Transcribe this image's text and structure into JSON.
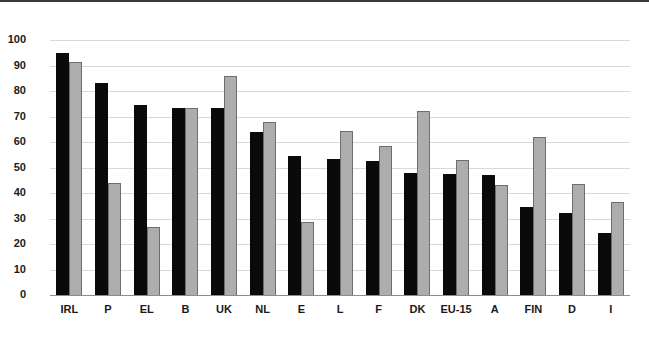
{
  "chart_data": {
    "type": "bar",
    "title": "",
    "subtitle": "",
    "xlabel": "",
    "ylabel": "",
    "ylim": [
      0,
      100
    ],
    "grid": true,
    "legend": "none",
    "orientation": "vertical",
    "categories": [
      "IRL",
      "P",
      "EL",
      "B",
      "UK",
      "NL",
      "E",
      "L",
      "F",
      "DK",
      "EU-15",
      "A",
      "FIN",
      "D",
      "I"
    ],
    "ytick_labels": [
      "100",
      "90",
      "80",
      "70",
      "60",
      "50",
      "40",
      "30",
      "20",
      "10",
      "0"
    ],
    "ytick_values": [
      100,
      90,
      80,
      70,
      60,
      50,
      40,
      30,
      20,
      10,
      0
    ],
    "series": [
      {
        "name": "series-a",
        "color": "#0a0a0a",
        "values": [
          95,
          83,
          74.5,
          73.5,
          73.5,
          64,
          54.5,
          53.5,
          52.5,
          48,
          47.5,
          47,
          34.5,
          32,
          24.5
        ]
      },
      {
        "name": "series-b",
        "color": "#adadad",
        "values": [
          91.5,
          44,
          26.5,
          73.5,
          86,
          68,
          28.5,
          64.5,
          58.5,
          72,
          53,
          43,
          62,
          43.5,
          36.5
        ]
      }
    ]
  },
  "colors": {
    "series_a": "#0a0a0a",
    "series_b": "#adadad",
    "series_b_outline": "#6e6e6e",
    "gridline": "#d9d9d9",
    "axis": "#8c8c8c",
    "background": "#ffffff",
    "text": "#1a1a1a"
  }
}
